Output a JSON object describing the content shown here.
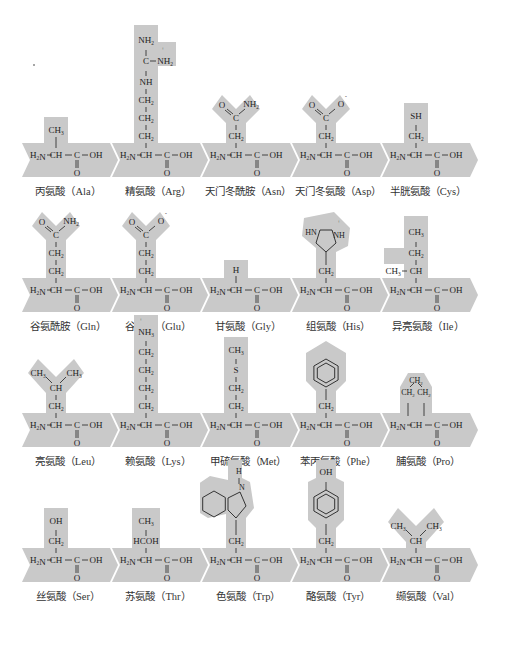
{
  "colors": {
    "shape_fill": "#c9c9c9",
    "text": "#222222"
  },
  "rows": [
    {
      "amino_acids": [
        {
          "name_cn": "丙氨酸",
          "abbr": "Ala",
          "label": "丙氨酸（Ala）",
          "side_chain": [
            "CH3"
          ]
        },
        {
          "name_cn": "精氨酸",
          "abbr": "Arg",
          "label": "精氨酸（Arg）",
          "side_chain": [
            "NH2",
            "C—NH2+",
            "NH",
            "CH2",
            "CH2",
            "CH2"
          ]
        },
        {
          "name_cn": "天门冬酰胺",
          "abbr": "Asn",
          "label": "天门冬酰胺（Asn）",
          "side_chain": [
            "O=C—NH2",
            "CH2"
          ]
        },
        {
          "name_cn": "天门冬氨酸",
          "abbr": "Asp",
          "label": "天门冬氨酸（Asp）",
          "side_chain": [
            "O=C—O-",
            "CH2"
          ]
        },
        {
          "name_cn": "半胱氨酸",
          "abbr": "Cys",
          "label": "半胱氨酸（Cys）",
          "side_chain": [
            "SH",
            "CH2"
          ]
        }
      ]
    },
    {
      "amino_acids": [
        {
          "name_cn": "谷氨酰胺",
          "abbr": "Gln",
          "label": "谷氨酰胺（Gln）",
          "side_chain": [
            "O=C—NH2",
            "CH2",
            "CH2"
          ]
        },
        {
          "name_cn": "谷氨酸",
          "abbr": "Glu",
          "label": "谷氨酸（Glu）",
          "side_chain": [
            "O=C—O-",
            "CH2",
            "CH2"
          ]
        },
        {
          "name_cn": "甘氨酸",
          "abbr": "Gly",
          "label": "甘氨酸（Gly）",
          "side_chain": [
            "H"
          ]
        },
        {
          "name_cn": "组氨酸",
          "abbr": "His",
          "label": "组氨酸（His）",
          "side_chain": [
            "imidazolium (HN, NH+)",
            "CH2"
          ]
        },
        {
          "name_cn": "异亮氨酸",
          "abbr": "Ile",
          "label": "异亮氨酸（Ile）",
          "side_chain": [
            "CH3",
            "CH2",
            "CH3—CH"
          ]
        }
      ]
    },
    {
      "amino_acids": [
        {
          "name_cn": "亮氨酸",
          "abbr": "Leu",
          "label": "亮氨酸（Leu）",
          "side_chain": [
            "CH3 CH3",
            "CH",
            "CH2"
          ]
        },
        {
          "name_cn": "赖氨酸",
          "abbr": "Lys",
          "label": "赖氨酸（Lys）",
          "side_chain": [
            "NH3+",
            "CH2",
            "CH2",
            "CH2",
            "CH2"
          ]
        },
        {
          "name_cn": "甲硫氨酸",
          "abbr": "Met",
          "label": "甲硫氨酸（Met）",
          "side_chain": [
            "CH3",
            "S",
            "CH2",
            "CH2"
          ]
        },
        {
          "name_cn": "苯丙氨酸",
          "abbr": "Phe",
          "label": "苯丙氨酸（Phe）",
          "side_chain": [
            "benzene ring",
            "CH2"
          ]
        },
        {
          "name_cn": "脯氨酸",
          "abbr": "Pro",
          "label": "脯氨酸（Pro）",
          "side_chain": [
            "CH2",
            "CH2 CH2"
          ]
        }
      ]
    },
    {
      "amino_acids": [
        {
          "name_cn": "丝氨酸",
          "abbr": "Ser",
          "label": "丝氨酸（Ser）",
          "side_chain": [
            "OH",
            "CH2"
          ]
        },
        {
          "name_cn": "苏氨酸",
          "abbr": "Thr",
          "label": "苏氨酸（Thr）",
          "side_chain": [
            "CH3",
            "HCOH"
          ]
        },
        {
          "name_cn": "色氨酸",
          "abbr": "Trp",
          "label": "色氨酸（Trp）",
          "side_chain": [
            "indole (H, N)",
            "CH2"
          ]
        },
        {
          "name_cn": "酪氨酸",
          "abbr": "Tyr",
          "label": "酪氨酸（Tyr）",
          "side_chain": [
            "OH",
            "phenol ring",
            "CH2"
          ]
        },
        {
          "name_cn": "缬氨酸",
          "abbr": "Val",
          "label": "缬氨酸（Val）",
          "side_chain": [
            "CH3 CH3",
            "CH"
          ]
        }
      ]
    }
  ],
  "backbone": {
    "amine": "H2N",
    "alpha": "CH",
    "carboxyl_c": "C",
    "hydroxyl": "OH",
    "carbonyl_o": "O"
  }
}
